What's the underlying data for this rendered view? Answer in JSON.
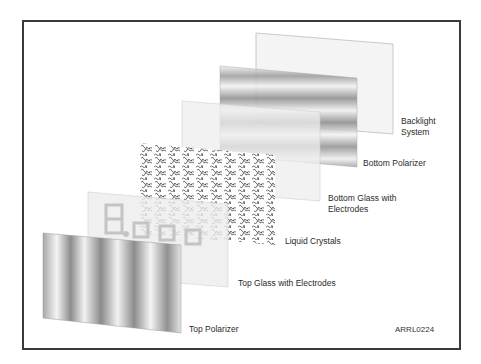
{
  "diagram": {
    "figure_id": "ARRL0224",
    "layers": [
      {
        "id": "backlight",
        "label_line1": "Backlight",
        "label_line2": "System",
        "pattern": "plain"
      },
      {
        "id": "bottom-polarizer",
        "label_line1": "Bottom Polarizer",
        "label_line2": "",
        "pattern": "horizontal-bands"
      },
      {
        "id": "bottom-glass",
        "label_line1": "Bottom Glass with",
        "label_line2": "Electrodes",
        "pattern": "plain"
      },
      {
        "id": "liquid-crystals",
        "label_line1": "Liquid Crystals",
        "label_line2": "",
        "pattern": "squiggles"
      },
      {
        "id": "top-glass",
        "label_line1": "Top Glass with Electrodes",
        "label_line2": "",
        "pattern": "seven-segment-digits"
      },
      {
        "id": "top-polarizer",
        "label_line1": "Top Polarizer",
        "label_line2": "",
        "pattern": "vertical-bands"
      }
    ],
    "digits_shown": "8.000",
    "colors": {
      "frame": "#3a3a3a",
      "glass": "#eeeeee",
      "band_dark": "#8a8a8a",
      "band_light": "#f2f2f2",
      "squiggle": "#222222"
    }
  }
}
